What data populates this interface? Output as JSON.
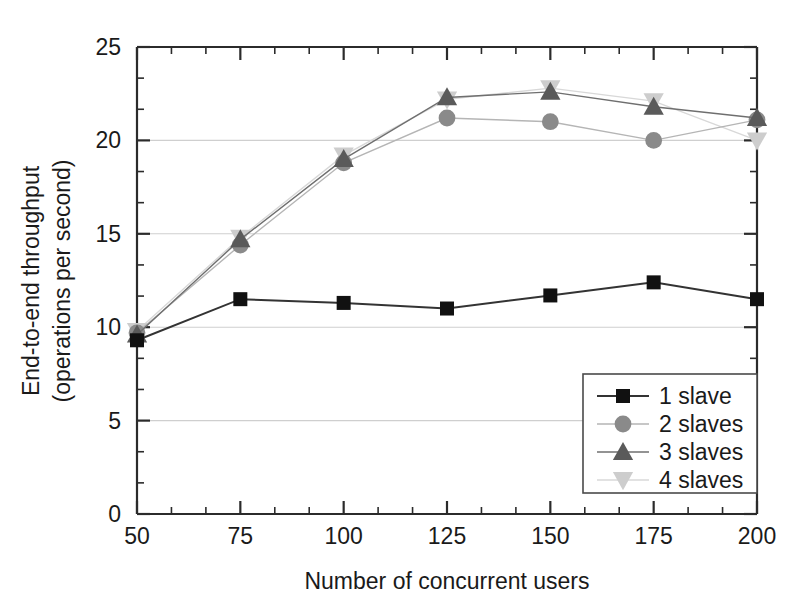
{
  "chart_data": {
    "type": "line",
    "title": "",
    "xlabel": "Number of concurrent users",
    "ylabel": "End-to-end throughput\n(operations per second)",
    "ylabel_line1": "End-to-end throughput",
    "ylabel_line2": "(operations per second)",
    "x": [
      50,
      75,
      100,
      125,
      150,
      175,
      200
    ],
    "xlim": [
      50,
      200
    ],
    "ylim": [
      0,
      25
    ],
    "xticks": [
      "50",
      "75",
      "100",
      "125",
      "150",
      "175",
      "200"
    ],
    "yticks": [
      "0",
      "5",
      "10",
      "15",
      "20",
      "25"
    ],
    "x_minor_ticks_per_interval": 2,
    "y_minor_ticks_per_interval": 2,
    "grid": "horizontal-major",
    "legend_position": "lower-right-inside",
    "series": [
      {
        "name": "1 slave",
        "marker": "square",
        "color": "#111111",
        "line_color": "#333333",
        "values": [
          9.3,
          11.5,
          11.3,
          11.0,
          11.7,
          12.4,
          11.5
        ]
      },
      {
        "name": "2 slaves",
        "marker": "circle",
        "color": "#8a8a8a",
        "line_color": "#b5b5b5",
        "values": [
          9.7,
          14.4,
          18.8,
          21.2,
          21.0,
          20.0,
          21.1
        ]
      },
      {
        "name": "3 slaves",
        "marker": "triangle-up",
        "color": "#5a5a5a",
        "line_color": "#6f6f6f",
        "values": [
          9.6,
          14.7,
          19.0,
          22.3,
          22.6,
          21.8,
          21.2
        ]
      },
      {
        "name": "4 slaves",
        "marker": "triangle-down",
        "color": "#cdcdcd",
        "line_color": "#d8d8d8",
        "values": [
          9.8,
          14.8,
          19.2,
          22.2,
          22.8,
          22.1,
          20.0
        ]
      }
    ]
  },
  "legend": {
    "entries": [
      {
        "label": "1 slave"
      },
      {
        "label": "2 slaves"
      },
      {
        "label": "3 slaves"
      },
      {
        "label": "4 slaves"
      }
    ]
  },
  "axes": {
    "x_title": "Number of concurrent users",
    "y_title_line1": "End-to-end throughput",
    "y_title_line2": "(operations per second)",
    "x_tick_labels": [
      "50",
      "75",
      "100",
      "125",
      "150",
      "175",
      "200"
    ],
    "y_tick_labels": [
      "0",
      "5",
      "10",
      "15",
      "20",
      "25"
    ]
  },
  "colors": {
    "frame": "#2b2b2b",
    "grid": "#cfcfcf",
    "series_1": "#111111",
    "series_2": "#8a8a8a",
    "series_3": "#5a5a5a",
    "series_4": "#cdcdcd",
    "background": "#ffffff"
  }
}
